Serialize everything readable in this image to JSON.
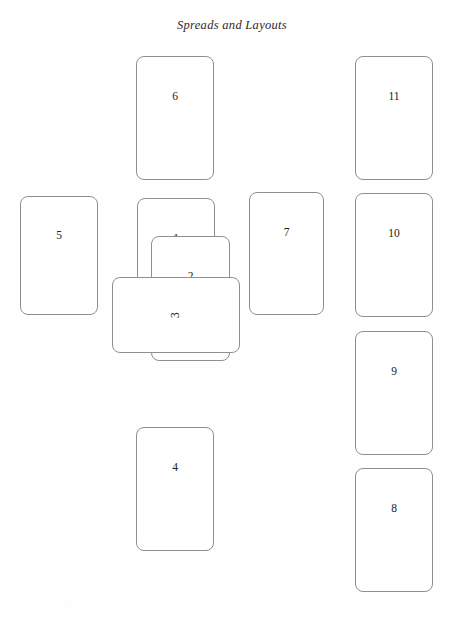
{
  "title": "Spreads and Layouts",
  "canvas": {
    "width": 464,
    "height": 628,
    "background": "#fefefe"
  },
  "style": {
    "card_stroke": "#8f8f8f",
    "card_fill": "#ffffff",
    "label_color": "#222222",
    "title_color": "#2b2b2b"
  },
  "diagram": {
    "kind": "tarot-spread-layout",
    "card_count": 11,
    "cards": [
      {
        "number": "1",
        "name": "position-1",
        "orientation": "upright",
        "x": 137,
        "y": 198,
        "w": 78,
        "h": 124,
        "z": 1
      },
      {
        "number": "2",
        "name": "position-2",
        "orientation": "upright",
        "x": 151,
        "y": 236,
        "w": 79,
        "h": 125,
        "z": 2
      },
      {
        "number": "3",
        "name": "position-3",
        "orientation": "rotated",
        "x": 112,
        "y": 277,
        "w": 128,
        "h": 76,
        "z": 3
      },
      {
        "number": "4",
        "name": "position-4",
        "orientation": "upright",
        "x": 136,
        "y": 427,
        "w": 78,
        "h": 124,
        "z": 1
      },
      {
        "number": "5",
        "name": "position-5",
        "orientation": "upright",
        "x": 20,
        "y": 196,
        "w": 78,
        "h": 119,
        "z": 1
      },
      {
        "number": "6",
        "name": "position-6",
        "orientation": "upright",
        "x": 136,
        "y": 56,
        "w": 78,
        "h": 124,
        "z": 1
      },
      {
        "number": "7",
        "name": "position-7",
        "orientation": "upright",
        "x": 249,
        "y": 192,
        "w": 75,
        "h": 123,
        "z": 1
      },
      {
        "number": "8",
        "name": "position-8",
        "orientation": "upright",
        "x": 355,
        "y": 468,
        "w": 78,
        "h": 124,
        "z": 1
      },
      {
        "number": "9",
        "name": "position-9",
        "orientation": "upright",
        "x": 355,
        "y": 331,
        "w": 78,
        "h": 124,
        "z": 1
      },
      {
        "number": "10",
        "name": "position-10",
        "orientation": "upright",
        "x": 355,
        "y": 193,
        "w": 78,
        "h": 124,
        "z": 1
      },
      {
        "number": "11",
        "name": "position-11",
        "orientation": "upright",
        "x": 355,
        "y": 56,
        "w": 78,
        "h": 124,
        "z": 1
      }
    ]
  },
  "scan_specks": [
    {
      "x": 388,
      "y": 641,
      "r": 2
    },
    {
      "x": 262,
      "y": 752,
      "r": 1
    },
    {
      "x": 70,
      "y": 604,
      "r": 1
    }
  ]
}
